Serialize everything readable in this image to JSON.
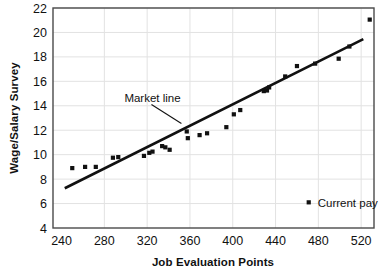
{
  "chart_data": {
    "type": "scatter",
    "title": "",
    "xlabel": "Job Evaluation Points",
    "ylabel": "Wage/Salary Survey",
    "xlim": [
      232,
      532
    ],
    "ylim": [
      4,
      22
    ],
    "xticks": [
      240,
      280,
      320,
      360,
      400,
      440,
      480,
      520
    ],
    "yticks": [
      4,
      6,
      8,
      10,
      12,
      14,
      16,
      18,
      20,
      22
    ],
    "grid": true,
    "legend_position": "inside-bottom-right",
    "series": [
      {
        "name": "Current pay",
        "marker": "square",
        "color": "#111111",
        "points": [
          [
            250,
            8.9
          ],
          [
            262,
            9.0
          ],
          [
            272,
            9.0
          ],
          [
            288,
            9.75
          ],
          [
            293,
            9.8
          ],
          [
            317,
            9.9
          ],
          [
            322,
            10.15
          ],
          [
            325,
            10.25
          ],
          [
            334,
            10.7
          ],
          [
            337,
            10.6
          ],
          [
            341,
            10.4
          ],
          [
            357,
            11.9
          ],
          [
            358,
            11.35
          ],
          [
            369,
            11.6
          ],
          [
            376,
            11.75
          ],
          [
            394,
            12.25
          ],
          [
            401,
            13.3
          ],
          [
            407,
            13.65
          ],
          [
            429,
            15.2
          ],
          [
            432,
            15.25
          ],
          [
            434,
            15.5
          ],
          [
            449,
            16.4
          ],
          [
            460,
            17.25
          ],
          [
            477,
            17.45
          ],
          [
            499,
            17.85
          ],
          [
            509,
            18.85
          ],
          [
            528,
            21.05
          ]
        ]
      }
    ],
    "trendline": {
      "label": "Market line",
      "x_start": 243,
      "y_start": 7.25,
      "x_end": 522,
      "y_end": 19.45,
      "color": "#111111"
    },
    "annotations": [
      {
        "text": "Market line",
        "x_text": 325,
        "y_text": 14.6,
        "leader_from": [
          324,
          14.1
        ],
        "leader_to": [
          352,
          12.55
        ]
      }
    ]
  },
  "legend": {
    "entries": [
      {
        "label": "Current pay",
        "marker": "square",
        "color": "#111111"
      }
    ]
  },
  "axes": {
    "x_title": "Job Evaluation Points",
    "y_title": "Wage/Salary Survey",
    "x_tick_labels": [
      "240",
      "280",
      "320",
      "360",
      "400",
      "440",
      "480",
      "520"
    ],
    "y_tick_labels": [
      "4",
      "6",
      "8",
      "10",
      "12",
      "14",
      "16",
      "18",
      "20",
      "22"
    ]
  },
  "colors": {
    "ink": "#111111",
    "grid": "#e2e2e2",
    "frame": "#4a4a4a",
    "background": "#ffffff"
  }
}
